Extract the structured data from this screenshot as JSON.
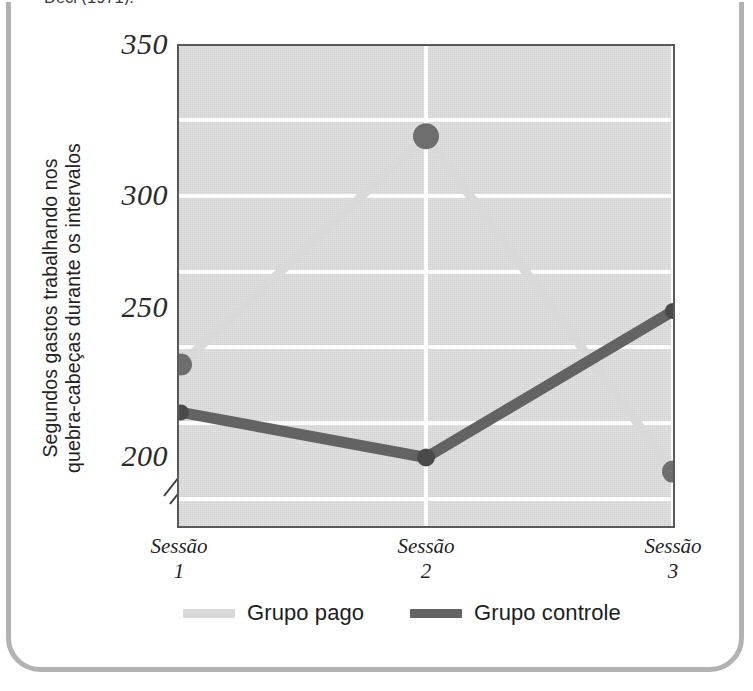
{
  "figure": {
    "caption_fragment": "Deci (1971).",
    "frame_color": "#b2b2b2",
    "plate_color": "#d2d2d2",
    "gridline_color": "#fdfdfd",
    "axis_break_symbol": "//"
  },
  "chart_data": {
    "type": "line",
    "title": "",
    "subtitle": "",
    "xlabel": "",
    "ylabel": "Segundos gastos trabalhando nos quebra-cabeças durante os intervalos",
    "ylabel_line1": "Segundos gastos trabalhando nos",
    "ylabel_line2": "quebra-cabeças durante os intervalos",
    "categories": [
      "Sessão 1",
      "Sessão 2",
      "Sessão 3"
    ],
    "category_lines": [
      {
        "name": "Sessão",
        "num": "1"
      },
      {
        "name": "Sessão",
        "num": "2"
      },
      {
        "name": "Sessão",
        "num": "3"
      }
    ],
    "ylim": [
      190,
      350
    ],
    "yticks": [
      350,
      300,
      250,
      200
    ],
    "ytick_labels": [
      "350",
      "300",
      "250",
      "200"
    ],
    "gridlines_y": [
      325,
      300,
      275,
      250,
      225,
      200
    ],
    "grid": true,
    "axis_break": true,
    "legend_position": "bottom",
    "series": [
      {
        "name": "Grupo pago",
        "color": "#d9d9d9",
        "marker_color": "#6e6e6e",
        "values": [
          237,
          318,
          199
        ]
      },
      {
        "name": "Grupo controle",
        "color": "#636363",
        "marker_color": "#4a4a4a",
        "values": [
          220,
          204,
          256
        ]
      }
    ],
    "legend": [
      {
        "label": "Grupo pago",
        "color": "#d9d9d9"
      },
      {
        "label": "Grupo controle",
        "color": "#636363"
      }
    ]
  }
}
